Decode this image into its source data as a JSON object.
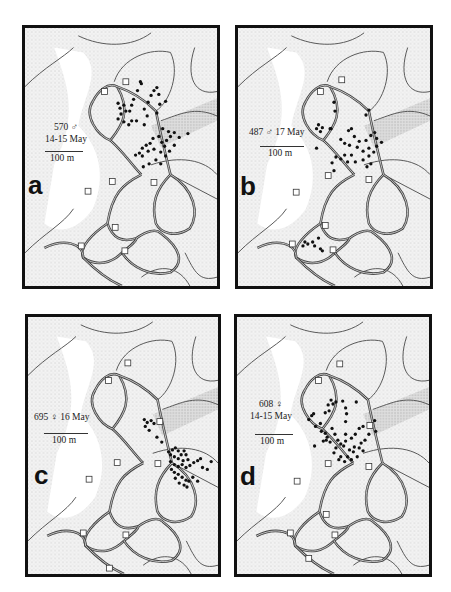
{
  "figure": {
    "panels": [
      {
        "id": "a",
        "letter": "a",
        "animal_id": "570 ♂",
        "date": "14-15 May",
        "caption_line1": "570 ♂",
        "caption_line2": "14-15 May",
        "scale_label": "100 m",
        "box": {
          "x": 22,
          "y": 25,
          "w": 198,
          "h": 264
        },
        "caption_pos": {
          "x": 45,
          "y": 121
        },
        "scale_pos": {
          "x": 45,
          "y": 151,
          "w": 38
        },
        "letter_pos": {
          "x": 28,
          "y": 172
        },
        "points": [
          [
            141,
            80
          ],
          [
            142,
            82
          ],
          [
            138,
            89
          ],
          [
            134,
            98
          ],
          [
            132,
            104
          ],
          [
            130,
            110
          ],
          [
            124,
            104
          ],
          [
            126,
            110
          ],
          [
            120,
            107
          ],
          [
            118,
            102
          ],
          [
            121,
            113
          ],
          [
            118,
            118
          ],
          [
            124,
            121
          ],
          [
            129,
            124
          ],
          [
            132,
            120
          ],
          [
            137,
            120
          ],
          [
            145,
            124
          ],
          [
            148,
            115
          ],
          [
            145,
            108
          ],
          [
            149,
            101
          ],
          [
            152,
            94
          ],
          [
            155,
            89
          ],
          [
            158,
            86
          ],
          [
            160,
            93
          ],
          [
            161,
            103
          ],
          [
            167,
            100
          ],
          [
            158,
            112
          ],
          [
            164,
            128
          ],
          [
            170,
            131
          ],
          [
            176,
            132
          ],
          [
            172,
            136
          ],
          [
            168,
            140
          ],
          [
            163,
            142
          ],
          [
            160,
            136
          ],
          [
            154,
            138
          ],
          [
            151,
            143
          ],
          [
            147,
            145
          ],
          [
            143,
            148
          ],
          [
            140,
            153
          ],
          [
            136,
            155
          ],
          [
            143,
            156
          ],
          [
            149,
            151
          ],
          [
            155,
            149
          ],
          [
            162,
            152
          ],
          [
            167,
            156
          ],
          [
            171,
            151
          ],
          [
            176,
            145
          ],
          [
            181,
            137
          ],
          [
            190,
            133
          ],
          [
            157,
            160
          ],
          [
            150,
            164
          ],
          [
            144,
            167
          ],
          [
            162,
            164
          ],
          [
            166,
            146
          ]
        ],
        "boxes": [
          [
            126,
            80
          ],
          [
            104,
            90
          ],
          [
            112,
            182
          ],
          [
            155,
            183
          ],
          [
            87,
            192
          ],
          [
            115,
            229
          ],
          [
            80,
            248
          ],
          [
            125,
            253
          ]
        ]
      },
      {
        "id": "b",
        "letter": "b",
        "animal_id": "487 ♂",
        "date": "17 May",
        "caption_line1": "487 ♂ 17 May",
        "caption_line2": "",
        "scale_label": "100 m",
        "box": {
          "x": 235,
          "y": 25,
          "w": 198,
          "h": 264
        },
        "caption_pos": {
          "x": 249,
          "y": 126
        },
        "scale_pos": {
          "x": 260,
          "y": 146,
          "w": 44
        },
        "letter_pos": {
          "x": 240,
          "y": 173
        },
        "points": [
          [
            334,
            101
          ],
          [
            335,
            110
          ],
          [
            370,
            109
          ],
          [
            367,
            114
          ],
          [
            318,
            124
          ],
          [
            316,
            128
          ],
          [
            320,
            131
          ],
          [
            322,
            127
          ],
          [
            330,
            128
          ],
          [
            349,
            130
          ],
          [
            352,
            128
          ],
          [
            355,
            136
          ],
          [
            341,
            139
          ],
          [
            345,
            143
          ],
          [
            350,
            145
          ],
          [
            360,
            141
          ],
          [
            367,
            140
          ],
          [
            372,
            135
          ],
          [
            376,
            132
          ],
          [
            378,
            138
          ],
          [
            370,
            148
          ],
          [
            364,
            151
          ],
          [
            358,
            147
          ],
          [
            352,
            155
          ],
          [
            345,
            155
          ],
          [
            348,
            162
          ],
          [
            356,
            162
          ],
          [
            364,
            160
          ],
          [
            370,
            156
          ],
          [
            375,
            152
          ],
          [
            378,
            146
          ],
          [
            383,
            142
          ],
          [
            372,
            164
          ],
          [
            368,
            167
          ],
          [
            336,
            157
          ],
          [
            341,
            159
          ],
          [
            332,
            163
          ],
          [
            334,
            171
          ],
          [
            331,
            128
          ],
          [
            316,
            148
          ],
          [
            304,
            244
          ],
          [
            302,
            248
          ],
          [
            307,
            246
          ],
          [
            312,
            244
          ],
          [
            314,
            248
          ],
          [
            318,
            240
          ],
          [
            320,
            251
          ],
          [
            322,
            253
          ]
        ],
        "boxes": [
          [
            342,
            78
          ],
          [
            320,
            90
          ],
          [
            328,
            176
          ],
          [
            370,
            180
          ],
          [
            295,
            193
          ],
          [
            325,
            227
          ],
          [
            291,
            246
          ],
          [
            333,
            252
          ]
        ]
      },
      {
        "id": "c",
        "letter": "c",
        "animal_id": "695 ♀",
        "date": "16 May",
        "caption_line1": "695 ♀ 16 May",
        "caption_line2": "",
        "scale_label": "100 m",
        "box": {
          "x": 25,
          "y": 314,
          "w": 196,
          "h": 263
        },
        "caption_pos": {
          "x": 34,
          "y": 411
        },
        "scale_pos": {
          "x": 44,
          "y": 433,
          "w": 44
        },
        "letter_pos": {
          "x": 34,
          "y": 462
        },
        "points": [
          [
            145,
            419
          ],
          [
            148,
            422
          ],
          [
            152,
            420
          ],
          [
            155,
            423
          ],
          [
            146,
            426
          ],
          [
            150,
            430
          ],
          [
            158,
            437
          ],
          [
            163,
            442
          ],
          [
            170,
            452
          ],
          [
            172,
            455
          ],
          [
            174,
            450
          ],
          [
            177,
            448
          ],
          [
            180,
            451
          ],
          [
            183,
            455
          ],
          [
            186,
            451
          ],
          [
            188,
            455
          ],
          [
            190,
            460
          ],
          [
            185,
            461
          ],
          [
            180,
            459
          ],
          [
            176,
            457
          ],
          [
            172,
            462
          ],
          [
            176,
            465
          ],
          [
            180,
            467
          ],
          [
            184,
            465
          ],
          [
            188,
            468
          ],
          [
            192,
            466
          ],
          [
            196,
            463
          ],
          [
            200,
            461
          ],
          [
            203,
            459
          ],
          [
            205,
            468
          ],
          [
            210,
            470
          ],
          [
            214,
            462
          ],
          [
            173,
            470
          ],
          [
            176,
            473
          ],
          [
            180,
            475
          ],
          [
            184,
            478
          ],
          [
            188,
            481
          ],
          [
            181,
            484
          ],
          [
            186,
            486
          ],
          [
            189,
            488
          ],
          [
            191,
            482
          ],
          [
            195,
            478
          ],
          [
            177,
            479
          ],
          [
            200,
            482
          ]
        ],
        "boxes": [
          [
            128,
            361
          ],
          [
            108,
            379
          ],
          [
            161,
            421
          ],
          [
            117,
            463
          ],
          [
            159,
            464
          ],
          [
            88,
            480
          ],
          [
            82,
            535
          ],
          [
            126,
            537
          ],
          [
            109,
            571
          ]
        ]
      },
      {
        "id": "d",
        "letter": "d",
        "animal_id": "608 ♀",
        "date": "14-15 May",
        "caption_line1": "608 ♀",
        "caption_line2": "14-15 May",
        "scale_label": "100 m",
        "box": {
          "x": 234,
          "y": 314,
          "w": 198,
          "h": 263
        },
        "caption_pos": {
          "x": 250,
          "y": 398
        },
        "scale_pos": {
          "x": 255,
          "y": 434,
          "w": 38
        },
        "letter_pos": {
          "x": 240,
          "y": 463
        },
        "points": [
          [
            331,
            399
          ],
          [
            333,
            403
          ],
          [
            336,
            401
          ],
          [
            328,
            404
          ],
          [
            329,
            410
          ],
          [
            325,
            412
          ],
          [
            343,
            400
          ],
          [
            346,
            407
          ],
          [
            347,
            413
          ],
          [
            357,
            401
          ],
          [
            346,
            421
          ],
          [
            311,
            415
          ],
          [
            313,
            413
          ],
          [
            308,
            419
          ],
          [
            315,
            426
          ],
          [
            320,
            423
          ],
          [
            321,
            431
          ],
          [
            325,
            433
          ],
          [
            327,
            437
          ],
          [
            330,
            442
          ],
          [
            326,
            440
          ],
          [
            335,
            434
          ],
          [
            338,
            440
          ],
          [
            341,
            444
          ],
          [
            346,
            441
          ],
          [
            352,
            438
          ],
          [
            356,
            434
          ],
          [
            360,
            428
          ],
          [
            364,
            426
          ],
          [
            376,
            420
          ],
          [
            377,
            431
          ],
          [
            370,
            434
          ],
          [
            366,
            440
          ],
          [
            362,
            443
          ],
          [
            355,
            447
          ],
          [
            350,
            450
          ],
          [
            344,
            446
          ],
          [
            336,
            448
          ],
          [
            334,
            453
          ],
          [
            341,
            457
          ],
          [
            348,
            457
          ],
          [
            354,
            452
          ],
          [
            360,
            448
          ],
          [
            364,
            451
          ],
          [
            358,
            457
          ],
          [
            352,
            460
          ],
          [
            345,
            462
          ],
          [
            339,
            460
          ],
          [
            323,
            441
          ],
          [
            314,
            446
          ],
          [
            346,
            434
          ],
          [
            332,
            428
          ]
        ],
        "boxes": [
          [
            340,
            362
          ],
          [
            318,
            379
          ],
          [
            371,
            425
          ],
          [
            328,
            464
          ],
          [
            370,
            467
          ],
          [
            296,
            482
          ],
          [
            326,
            516
          ],
          [
            289,
            535
          ],
          [
            335,
            537
          ],
          [
            308,
            561
          ]
        ]
      }
    ]
  }
}
